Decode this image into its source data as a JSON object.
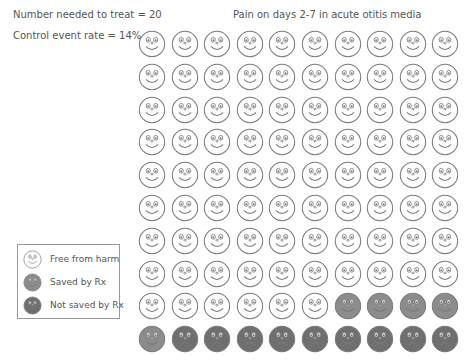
{
  "stats": {
    "nnt_label": "Number needed to treat = 20",
    "cer_label": "Control event rate = 14%"
  },
  "title": "Pain on days 2-7 in acute otitis media",
  "legend": {
    "items": [
      {
        "key": "free",
        "label": "Free from harm"
      },
      {
        "key": "saved",
        "label": "Saved by Rx"
      },
      {
        "key": "not_saved",
        "label": "Not saved by Rx"
      }
    ]
  },
  "colors": {
    "free": "#ffffff",
    "saved": "#8c8c8c",
    "not_saved": "#6f6f6f",
    "outline": "#7a7a7a"
  },
  "chart_data": {
    "type": "icon-array",
    "title": "Pain on days 2-7 in acute otitis media",
    "rows": 10,
    "cols": 10,
    "total": 100,
    "counts": {
      "Free from harm": 86,
      "Saved by Rx": 5,
      "Not saved by Rx": 9
    },
    "annotations": [
      "Number needed to treat = 20",
      "Control event rate = 14%"
    ],
    "layout": "row-major; saved fill last 4 of row 9 and first of row 10; not saved fill last 9 of row 10"
  }
}
